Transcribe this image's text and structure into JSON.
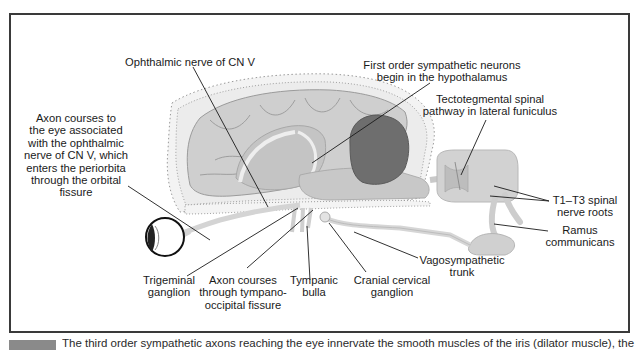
{
  "figure": {
    "labels": {
      "ophthalmic_nerve": "Ophthalmic nerve of CN V",
      "first_order_neurons": "First order sympathetic neurons\nbegin in the hypothalamus",
      "tectotegmental": "Tectotegmental spinal\npathway in lateral funiculus",
      "axon_to_eye": "Axon courses to\nthe eye associated\nwith the ophthalmic\nnerve of CN V, which\nenters the periorbita\nthrough the orbital\nfissure",
      "t1_t3": "T1–T3 spinal\nnerve roots",
      "ramus": "Ramus\ncommunicans",
      "vagosympathetic": "Vagosympathetic\ntrunk",
      "trigeminal": "Trigeminal\nganglion",
      "tympano_occipital": "Axon courses\nthrough tympano-\noccipital fissure",
      "tympanic_bulla": "Tympanic\nbulla",
      "cranial_cervical": "Cranial cervical\nganglion"
    },
    "colors": {
      "frame": "#3a3a3a",
      "brain_light": "#cfcfcf",
      "brain_mid": "#b9b9b9",
      "cerebellum": "#6e6e6e",
      "skull": "#f1f1f1",
      "leader": "#1a1a1a"
    }
  },
  "caption": {
    "text": "The third order sympathetic axons reaching the eye innervate the smooth muscles of the iris (dilator muscle), the"
  }
}
